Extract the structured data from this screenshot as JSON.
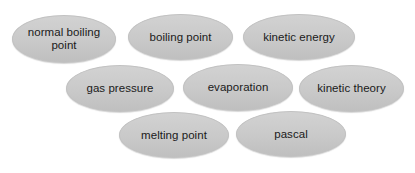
{
  "canvas": {
    "width": 415,
    "height": 173,
    "background_color": "#ffffff"
  },
  "style": {
    "oval_fill_color": "#c9c9c9",
    "oval_border_color": "#c2c2c2",
    "label_text_color": "#1a1a1a"
  },
  "ovals": [
    {
      "label": "normal boiling\npoint",
      "row": 1,
      "x": 12,
      "y": 15,
      "width": 104,
      "height": 48
    },
    {
      "label": "boiling point",
      "row": 1,
      "x": 128,
      "y": 14,
      "width": 105,
      "height": 46
    },
    {
      "label": "kinetic energy",
      "row": 1,
      "x": 243,
      "y": 14,
      "width": 112,
      "height": 46
    },
    {
      "label": "gas pressure",
      "row": 2,
      "x": 66,
      "y": 65,
      "width": 108,
      "height": 47
    },
    {
      "label": "evaporation",
      "row": 2,
      "x": 183,
      "y": 64,
      "width": 110,
      "height": 47
    },
    {
      "label": "kinetic theory",
      "row": 2,
      "x": 299,
      "y": 65,
      "width": 105,
      "height": 47
    },
    {
      "label": "melting point",
      "row": 3,
      "x": 119,
      "y": 112,
      "width": 110,
      "height": 46
    },
    {
      "label": "pascal",
      "row": 3,
      "x": 236,
      "y": 111,
      "width": 110,
      "height": 46
    }
  ]
}
